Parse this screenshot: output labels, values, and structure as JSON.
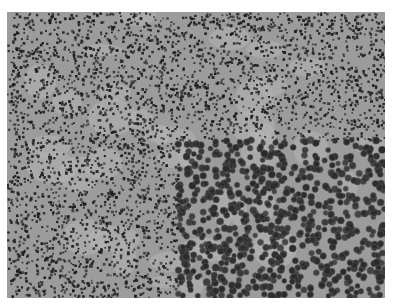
{
  "image": {
    "description": "Grayscale light micrograph of densely packed small dark round cells on a light gray background, with a magnified inset in the lower-right quadrant showing larger round cells",
    "background_color": "#ffffff",
    "field_color": "#9c9c9c",
    "cell_color": "#1e1e1e",
    "frame": {
      "x": 7,
      "y": 12,
      "width": 378,
      "height": 286
    },
    "inset": {
      "x": 171,
      "y": 128,
      "width": 207,
      "height": 158
    }
  }
}
